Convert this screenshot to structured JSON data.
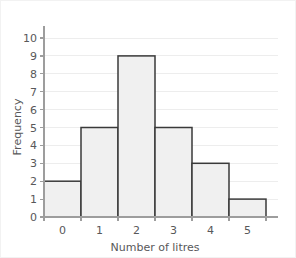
{
  "chart_data": {
    "type": "bar",
    "title": "",
    "subtitle": "",
    "xlabel": "Number of litres",
    "ylabel": "Frequency",
    "categories": [
      "0",
      "1",
      "2",
      "3",
      "4",
      "5"
    ],
    "values": [
      2,
      5,
      9,
      5,
      3,
      1
    ],
    "series": [
      {
        "name": "Frequency",
        "values": [
          2,
          5,
          9,
          5,
          3,
          1
        ]
      }
    ],
    "ylim": [
      0,
      10
    ],
    "yticks": [
      0,
      1,
      2,
      3,
      4,
      5,
      6,
      7,
      8,
      9,
      10
    ],
    "ytick_labels": [
      "0",
      "1",
      "2",
      "3",
      "4",
      "5",
      "6",
      "7",
      "8",
      "9",
      "10"
    ],
    "xticks": [
      0,
      1,
      2,
      3,
      4,
      5
    ],
    "xtick_labels": [
      "0",
      "1",
      "2",
      "3",
      "4",
      "5"
    ],
    "grid": true,
    "grid_axis": "y",
    "legend": false,
    "legend_position": "none",
    "bar_gap": 0,
    "annotations": []
  },
  "style": {
    "bar_fill": "#f0f0f0",
    "bar_stroke": "#3a3a3a",
    "grid_color": "#ededed",
    "axis_color": "#9d9d9d",
    "text_color": "#58585a",
    "background": "#ffffff",
    "frame_color": "#f2f2f2"
  },
  "geometry": {
    "width": 296,
    "height": 258,
    "plot_left": 43,
    "plot_right": 265,
    "plot_top": 37,
    "plot_bottom": 216
  }
}
